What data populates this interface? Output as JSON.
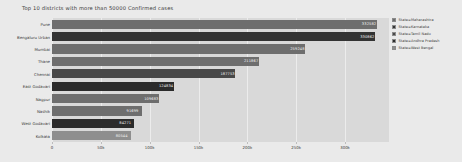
{
  "chart_data": {
    "type": "bar",
    "orientation": "horizontal",
    "title": "Top 10 districts with more than 50000 Confirmed cases",
    "xlabel": "",
    "ylabel": "",
    "xlim": [
      0,
      345000
    ],
    "xticks": [
      0,
      50000,
      100000,
      150000,
      200000,
      250000,
      300000
    ],
    "xticklabels": [
      "0",
      "50k",
      "100k",
      "150k",
      "200k",
      "250k",
      "300k"
    ],
    "grid": true,
    "grid_axis": "x",
    "legend_position": "right",
    "categories": [
      "Pune",
      "Bengaluru Urban",
      "Mumbai",
      "Thane",
      "Chennai",
      "East Godavari",
      "Nagpur",
      "Nashik",
      "West Godavari",
      "Kolkata"
    ],
    "values": [
      332582,
      330862,
      259248,
      211867,
      187753,
      124834,
      109683,
      91699,
      84271,
      80544
    ],
    "value_labels": [
      "332582",
      "330862",
      "259248",
      "211867",
      "187753",
      "124834",
      "109683",
      "91699",
      "84271",
      "80544"
    ],
    "point_states": [
      "Maharashtra",
      "Karnataka",
      "Maharashtra",
      "Maharashtra",
      "Tamil Nadu",
      "Andhra Pradesh",
      "Maharashtra",
      "Maharashtra",
      "Andhra Pradesh",
      "West Bengal"
    ],
    "point_colors": [
      "#6e6e6e",
      "#333333",
      "#6e6e6e",
      "#6e6e6e",
      "#484848",
      "#2b2b2b",
      "#6e6e6e",
      "#6e6e6e",
      "#2b2b2b",
      "#8e8e8e"
    ],
    "series": [
      {
        "name": "State=Maharashtra",
        "color": "#6e6e6e"
      },
      {
        "name": "State=Karnataka",
        "color": "#333333"
      },
      {
        "name": "State=Tamil Nadu",
        "color": "#484848"
      },
      {
        "name": "State=Andhra Pradesh",
        "color": "#2b2b2b"
      },
      {
        "name": "State=West Bengal",
        "color": "#8e8e8e"
      }
    ]
  },
  "legend": {
    "items": [
      {
        "label": "State=Maharashtra",
        "color": "#6e6e6e"
      },
      {
        "label": "State=Karnataka",
        "color": "#333333"
      },
      {
        "label": "State=Tamil Nadu",
        "color": "#484848"
      },
      {
        "label": "State=Andhra Pradesh",
        "color": "#2b2b2b"
      },
      {
        "label": "State=West Bengal",
        "color": "#8e8e8e"
      }
    ]
  },
  "colors": {
    "figure_background": "#eaeaea",
    "plot_background": "#d9d9d9",
    "gridline": "#f0f0f0",
    "text": "#3c3c3c",
    "bar_label_text": "#f2f2f2"
  }
}
